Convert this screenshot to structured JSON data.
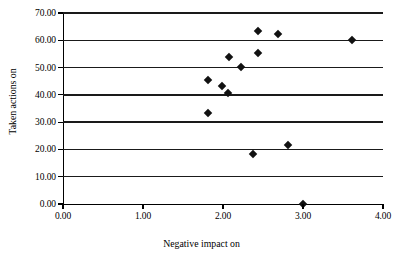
{
  "chart_data": {
    "type": "scatter",
    "title": "",
    "xlabel": "Negative impact on",
    "ylabel": "Taken actions on",
    "xlim": [
      0,
      4
    ],
    "ylim": [
      0,
      70
    ],
    "xticks": [
      "0.00",
      "1.00",
      "2.00",
      "3.00",
      "4.00"
    ],
    "yticks": [
      "0.00",
      "10.00",
      "20.00",
      "30.00",
      "40.00",
      "50.00",
      "60.00",
      "70.00"
    ],
    "xtick_values": [
      0,
      1,
      2,
      3,
      4
    ],
    "ytick_values": [
      0,
      10,
      20,
      30,
      40,
      50,
      60,
      70
    ],
    "grid": "horizontal",
    "legend": "none",
    "marker": "diamond",
    "marker_color": "#111111",
    "series": [
      {
        "name": "observations",
        "points": [
          {
            "x": 1.81,
            "y": 33.4
          },
          {
            "x": 1.81,
            "y": 45.5
          },
          {
            "x": 1.99,
            "y": 43.3
          },
          {
            "x": 2.06,
            "y": 40.7
          },
          {
            "x": 2.08,
            "y": 53.9
          },
          {
            "x": 2.22,
            "y": 50.2
          },
          {
            "x": 2.38,
            "y": 18.5
          },
          {
            "x": 2.44,
            "y": 63.4
          },
          {
            "x": 2.44,
            "y": 55.4
          },
          {
            "x": 2.69,
            "y": 62.3
          },
          {
            "x": 2.81,
            "y": 21.6
          },
          {
            "x": 3.0,
            "y": 0.0
          },
          {
            "x": 3.61,
            "y": 60.1
          }
        ]
      }
    ]
  }
}
